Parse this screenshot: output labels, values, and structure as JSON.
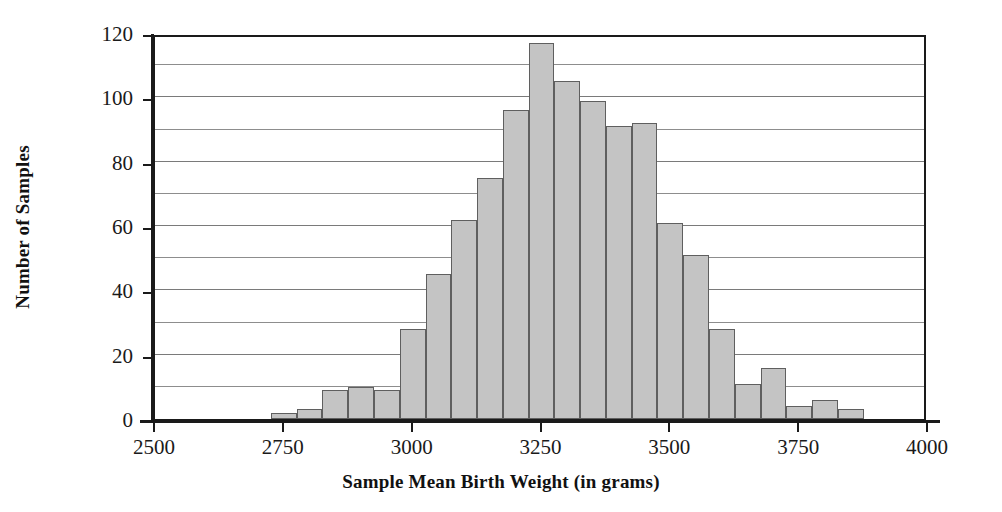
{
  "chart_data": {
    "type": "bar",
    "title": "",
    "xlabel": "Sample Mean Birth Weight (in grams)",
    "ylabel": "Number of Samples",
    "xlim": [
      2500,
      4000
    ],
    "ylim": [
      0,
      120
    ],
    "bin_width": 50,
    "grid": "horizontal",
    "legend": "none",
    "x_ticks": [
      2500,
      2750,
      3000,
      3250,
      3500,
      3750,
      4000
    ],
    "x_tick_labels": [
      "2500",
      "2750",
      "3000",
      "3250",
      "3500",
      "3750",
      "4000"
    ],
    "y_ticks": [
      0,
      20,
      40,
      60,
      80,
      100,
      120
    ],
    "y_tick_labels": [
      "0",
      "20",
      "40",
      "60",
      "80",
      "100",
      "120"
    ],
    "y_gridlines": [
      10,
      20,
      30,
      40,
      50,
      60,
      70,
      80,
      90,
      100,
      110
    ],
    "bar_fill_color": "#c4c4c4",
    "bar_edge_color": "#5f5f5f",
    "axis_color": "#1a1a1a",
    "bins": [
      {
        "start": 2725,
        "end": 2775,
        "center": 2750,
        "value": 2
      },
      {
        "start": 2775,
        "end": 2825,
        "center": 2800,
        "value": 3
      },
      {
        "start": 2825,
        "end": 2875,
        "center": 2850,
        "value": 9
      },
      {
        "start": 2875,
        "end": 2925,
        "center": 2900,
        "value": 10
      },
      {
        "start": 2925,
        "end": 2975,
        "center": 2950,
        "value": 9
      },
      {
        "start": 2975,
        "end": 3025,
        "center": 3000,
        "value": 28
      },
      {
        "start": 3025,
        "end": 3075,
        "center": 3050,
        "value": 45
      },
      {
        "start": 3075,
        "end": 3125,
        "center": 3100,
        "value": 62
      },
      {
        "start": 3125,
        "end": 3175,
        "center": 3150,
        "value": 75
      },
      {
        "start": 3175,
        "end": 3225,
        "center": 3200,
        "value": 96
      },
      {
        "start": 3225,
        "end": 3275,
        "center": 3250,
        "value": 117
      },
      {
        "start": 3275,
        "end": 3325,
        "center": 3300,
        "value": 105
      },
      {
        "start": 3325,
        "end": 3375,
        "center": 3350,
        "value": 99
      },
      {
        "start": 3375,
        "end": 3425,
        "center": 3400,
        "value": 91
      },
      {
        "start": 3425,
        "end": 3475,
        "center": 3450,
        "value": 92
      },
      {
        "start": 3475,
        "end": 3525,
        "center": 3500,
        "value": 61
      },
      {
        "start": 3525,
        "end": 3575,
        "center": 3550,
        "value": 51
      },
      {
        "start": 3575,
        "end": 3625,
        "center": 3600,
        "value": 28
      },
      {
        "start": 3625,
        "end": 3675,
        "center": 3650,
        "value": 11
      },
      {
        "start": 3675,
        "end": 3725,
        "center": 3700,
        "value": 16
      },
      {
        "start": 3725,
        "end": 3775,
        "center": 3750,
        "value": 4
      },
      {
        "start": 3775,
        "end": 3825,
        "center": 3800,
        "value": 6
      },
      {
        "start": 3825,
        "end": 3875,
        "center": 3850,
        "value": 3
      }
    ]
  }
}
